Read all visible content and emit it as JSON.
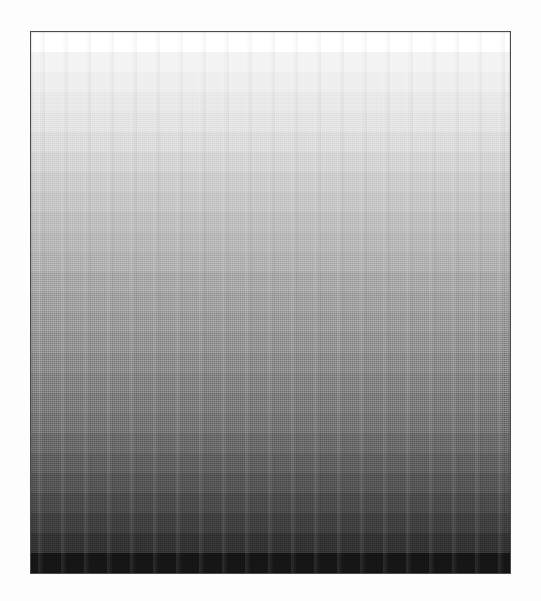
{
  "page": {
    "background_color": "#fdfdfd",
    "width_px": 541,
    "height_px": 601
  },
  "frame": {
    "border_color": "#4a4a4a",
    "border_width_px": 1.5,
    "left_px": 30,
    "top_px": 31,
    "width_px": 481,
    "height_px": 543
  },
  "chart_data": {
    "type": "heatmap",
    "title": "",
    "subtitle": "",
    "xlabel": "",
    "ylabel": "",
    "orientation": "vertical",
    "grid": false,
    "legend_position": "none",
    "categories": [
      "step-01",
      "step-02",
      "step-03",
      "step-04",
      "step-05",
      "step-06",
      "step-07",
      "step-08",
      "step-09",
      "step-10",
      "step-11",
      "step-12",
      "step-13",
      "step-14",
      "step-15",
      "step-16",
      "step-17",
      "step-18",
      "step-19",
      "step-20",
      "step-21",
      "step-22",
      "step-23",
      "step-24",
      "step-25",
      "step-26",
      "step-27"
    ],
    "values": [
      100,
      95,
      93,
      90,
      88,
      85,
      82,
      79,
      76,
      73,
      70,
      67,
      63,
      60,
      57,
      54,
      50,
      47,
      44,
      41,
      37,
      33,
      29,
      25,
      21,
      16,
      6
    ],
    "ylim": [
      0,
      100
    ],
    "value_unit": "percent-luminance",
    "colors": [
      "#ffffff",
      "#f3f3f3",
      "#eeeeee",
      "#e8e8e8",
      "#e2e2e2",
      "#dadada",
      "#d2d2d2",
      "#cacaca",
      "#c3c3c3",
      "#bbbbbb",
      "#b4b4b4",
      "#adadad",
      "#a3a3a3",
      "#9c9c9c",
      "#959595",
      "#8e8e8e",
      "#858585",
      "#7d7d7d",
      "#767676",
      "#6f6f6f",
      "#656565",
      "#5b5b5b",
      "#515151",
      "#474747",
      "#3c3c3c",
      "#303030",
      "#141414"
    ]
  },
  "texture": {
    "dither_pattern": "halftone-screen",
    "scan_streaks": true
  }
}
